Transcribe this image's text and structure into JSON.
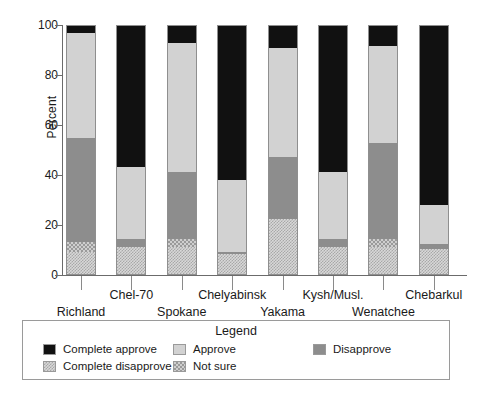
{
  "chart_data": {
    "type": "bar",
    "stacked": true,
    "title": "",
    "xlabel": "",
    "ylabel": "Percent",
    "ylim": [
      0,
      100
    ],
    "yticks": [
      0,
      20,
      40,
      60,
      80,
      100
    ],
    "grid": false,
    "legend_position": "bottom",
    "legend_title": "Legend",
    "categories": [
      "Richland",
      "Chel-70",
      "Spokane",
      "Chelyabinsk",
      "Yakama",
      "Kysh/Musl.",
      "Wenatchee",
      "Chebarkul"
    ],
    "series": [
      {
        "name": "Complete approve",
        "fill": "solid-black",
        "color": "#111111",
        "values": [
          3,
          57,
          7,
          62,
          9,
          59,
          8,
          72
        ]
      },
      {
        "name": "Approve",
        "fill": "solid-light-gray",
        "color": "#d2d2d2",
        "values": [
          42,
          29,
          52,
          29,
          44,
          27,
          39,
          16
        ]
      },
      {
        "name": "Disapprove",
        "fill": "solid-medium-gray",
        "color": "#8d8d8d",
        "values": [
          42,
          3,
          27,
          1,
          25,
          3,
          39,
          2
        ]
      },
      {
        "name": "Not sure",
        "fill": "checkered",
        "color": "#cfcfcf",
        "values": [
          4,
          0,
          3,
          0,
          0,
          0,
          3,
          0
        ]
      },
      {
        "name": "Complete disapprove",
        "fill": "checkered-light",
        "color": "#d8d8d8",
        "values": [
          9,
          11,
          11,
          8,
          22,
          11,
          11,
          10
        ]
      }
    ]
  },
  "axis": {
    "y_title": "Percent",
    "y_tick_labels": [
      "100",
      "80",
      "60",
      "40",
      "20",
      "0"
    ]
  },
  "legend": {
    "title": "Legend",
    "items": [
      {
        "label": "Complete approve",
        "swatch": "complete-approve-swatch"
      },
      {
        "label": "Complete disapprove",
        "swatch": "complete-disapprove-swatch"
      },
      {
        "label": "Approve",
        "swatch": "approve-swatch"
      },
      {
        "label": "Not sure",
        "swatch": "not-sure-swatch"
      },
      {
        "label": "Disapprove",
        "swatch": "disapprove-swatch"
      }
    ]
  },
  "x_labels": [
    {
      "text": "Richland",
      "row": "bottom"
    },
    {
      "text": "Chel-70",
      "row": "top"
    },
    {
      "text": "Spokane",
      "row": "bottom"
    },
    {
      "text": "Chelyabinsk",
      "row": "top"
    },
    {
      "text": "Yakama",
      "row": "bottom"
    },
    {
      "text": "Kysh/Musl.",
      "row": "top"
    },
    {
      "text": "Wenatchee",
      "row": "bottom"
    },
    {
      "text": "Chebarkul",
      "row": "top"
    }
  ]
}
